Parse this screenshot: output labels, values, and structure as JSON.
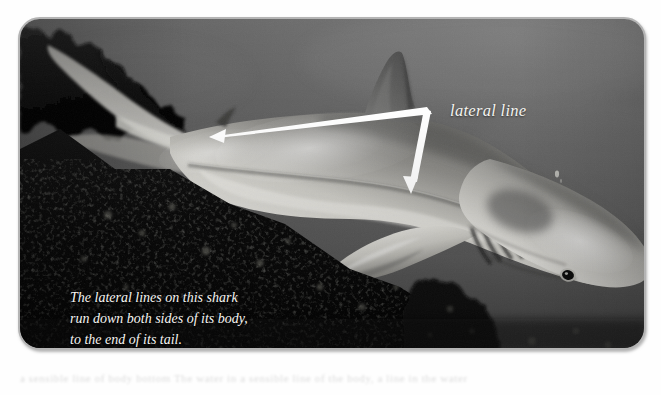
{
  "figure": {
    "kind": "annotated-photograph"
  },
  "annotations": {
    "label": "lateral line",
    "leader_arrows": 2,
    "arrow_color": "#ffffff"
  },
  "caption": {
    "text": "The lateral lines on this shark\nrun down both sides of its body,\nto the end of its tail."
  },
  "ghost_text": {
    "text": "a sensible line of body bottom  The water in a sensible line of the body, a line in the water"
  },
  "frame": {
    "border_color": "#b4b4b4",
    "corner_radius_px": 22,
    "page_background": "#ffffff"
  },
  "palette": {
    "water": "#5b5b5b",
    "water_highlight": "#6d6d6d",
    "rock_dark": "#060606",
    "shark_belly": "#ededea",
    "shark_back": "#6f6f6f",
    "annotation_white": "#ffffff",
    "caption_white": "#f6f5f2"
  }
}
